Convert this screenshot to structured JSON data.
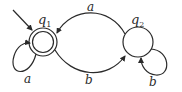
{
  "diagram": {
    "type": "DFA state diagram",
    "states": [
      {
        "id": "q1",
        "label": "q",
        "subscript": "1",
        "start": true,
        "accept": true
      },
      {
        "id": "q2",
        "label": "q",
        "subscript": "2",
        "start": false,
        "accept": false
      }
    ],
    "transitions": [
      {
        "from": "q1",
        "to": "q1",
        "symbol": "a"
      },
      {
        "from": "q1",
        "to": "q2",
        "symbol": "b"
      },
      {
        "from": "q2",
        "to": "q1",
        "symbol": "a"
      },
      {
        "from": "q2",
        "to": "q2",
        "symbol": "b"
      }
    ],
    "labels": {
      "q1_name": "q",
      "q1_sub": "1",
      "q2_name": "q",
      "q2_sub": "2",
      "q1_self_loop": "a",
      "q1_to_q2": "b",
      "q2_to_q1": "a",
      "q2_self_loop": "b"
    },
    "colors": {
      "stroke": "#2a2a2a",
      "background": "#ffffff"
    }
  }
}
